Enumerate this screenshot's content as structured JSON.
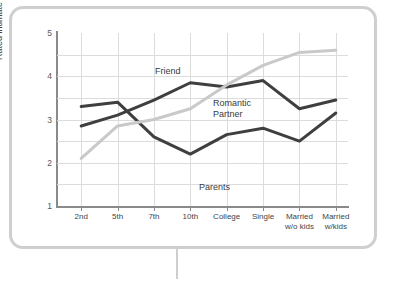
{
  "chart_data": {
    "type": "line",
    "title": "",
    "xlabel": "",
    "ylabel": "Rated intimate disclosure",
    "categories": [
      "2nd",
      "5th",
      "7th",
      "10th",
      "College",
      "Single",
      "Married\nw/o kids",
      "Married\nw/kids"
    ],
    "ylim": [
      1,
      5
    ],
    "yticks": [
      1,
      2,
      3,
      4,
      5
    ],
    "grid": true,
    "legend_position": "inline-annotations",
    "series": [
      {
        "name": "Parents",
        "color": "#3f3f3f",
        "values": [
          3.3,
          3.4,
          2.6,
          2.2,
          2.65,
          2.8,
          2.5,
          3.15
        ]
      },
      {
        "name": "Friend",
        "color": "#3f3f3f",
        "values": [
          2.85,
          3.1,
          3.45,
          3.85,
          3.75,
          3.9,
          3.25,
          3.45
        ]
      },
      {
        "name": "Romantic Partner",
        "color": "#c9c9c9",
        "values": [
          2.1,
          2.85,
          3.0,
          3.25,
          3.8,
          4.25,
          4.55,
          4.6
        ]
      }
    ],
    "annotations": [
      {
        "text": "Friend",
        "x_px": 155,
        "y_px": 66
      },
      {
        "text": "Romantic\nPartner",
        "x_px": 213,
        "y_px": 98
      },
      {
        "text": "Parents",
        "x_px": 199,
        "y_px": 182
      }
    ]
  }
}
